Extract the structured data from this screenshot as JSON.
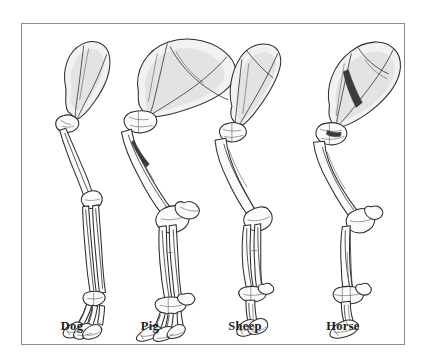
{
  "figure": {
    "frame": {
      "border_color": "#8c8c8c",
      "background_color": "#ffffff",
      "left": 21,
      "top": 23,
      "width": 384,
      "height": 322
    },
    "style": {
      "line_color": "#2c2c2c",
      "bone_fill": "#fbfbfa",
      "shade_fill": "#e3e3e2",
      "label_color": "#1b1b1b"
    },
    "specimens": [
      {
        "id": "dog",
        "label": "Dog",
        "label_center_x": 72,
        "label_baseline_y": 332,
        "foot_type": "digitigrade-paw",
        "digit_count": "four-weight-bearing",
        "scapula_shape": "narrow-oval",
        "metacarpal_arrangement": "separate-splayed"
      },
      {
        "id": "pig",
        "label": "Pig",
        "label_center_x": 150,
        "label_baseline_y": 332,
        "foot_type": "cloven-hoof",
        "digit_count": "two-main-two-dewclaws",
        "scapula_shape": "broad-fan",
        "metacarpal_arrangement": "paired-plus-lateral"
      },
      {
        "id": "sheep",
        "label": "Sheep",
        "label_center_x": 245,
        "label_baseline_y": 332,
        "foot_type": "cloven-hoof",
        "digit_count": "two-main",
        "scapula_shape": "elongate-triangular",
        "metacarpal_arrangement": "fused-cannon-split-tip"
      },
      {
        "id": "horse",
        "label": "Horse",
        "label_center_x": 343,
        "label_baseline_y": 332,
        "foot_type": "single-hoof",
        "digit_count": "one",
        "scapula_shape": "broad-rounded-with-spine",
        "metacarpal_arrangement": "single-cannon-bone"
      }
    ]
  }
}
